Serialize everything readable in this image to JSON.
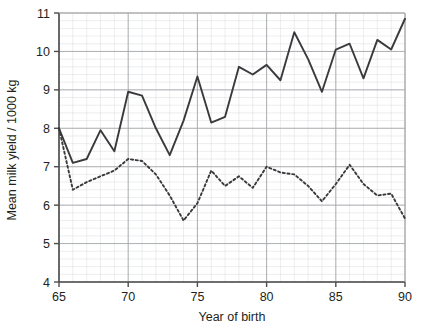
{
  "chart_data": {
    "type": "line",
    "title": "",
    "xlabel": "Year of birth",
    "ylabel": "Mean milk yield / 1000 kg",
    "xlim": [
      65,
      90
    ],
    "ylim": [
      4,
      11
    ],
    "x_ticks": [
      65,
      70,
      75,
      80,
      85,
      90
    ],
    "x_tick_labels": [
      "65",
      "70",
      "75",
      "80",
      "85",
      "90"
    ],
    "y_ticks": [
      4,
      5,
      6,
      7,
      8,
      9,
      10,
      11
    ],
    "y_tick_labels": [
      "4",
      "5",
      "6",
      "7",
      "8",
      "9",
      "10",
      "11"
    ],
    "grid": true,
    "grid_minor": true,
    "legend": "none",
    "x": [
      65,
      66,
      67,
      68,
      69,
      70,
      71,
      72,
      73,
      74,
      75,
      76,
      77,
      78,
      79,
      80,
      81,
      82,
      83,
      84,
      85,
      86,
      87,
      88,
      89,
      90
    ],
    "series": [
      {
        "name": "solid-line",
        "style": "solid",
        "values": [
          8.0,
          7.1,
          7.2,
          7.95,
          7.4,
          8.95,
          8.85,
          8.0,
          7.3,
          8.2,
          9.35,
          8.15,
          8.3,
          9.6,
          9.4,
          9.65,
          9.25,
          10.5,
          9.8,
          8.95,
          10.05,
          10.2,
          9.3,
          10.3,
          10.05,
          10.85
        ]
      },
      {
        "name": "dashed-line",
        "style": "dashed",
        "values": [
          8.0,
          6.4,
          6.6,
          6.75,
          6.9,
          7.2,
          7.15,
          6.8,
          6.25,
          5.6,
          6.05,
          6.9,
          6.5,
          6.75,
          6.45,
          7.0,
          6.85,
          6.8,
          6.5,
          6.1,
          6.55,
          7.05,
          6.55,
          6.25,
          6.3,
          5.65
        ]
      }
    ]
  }
}
